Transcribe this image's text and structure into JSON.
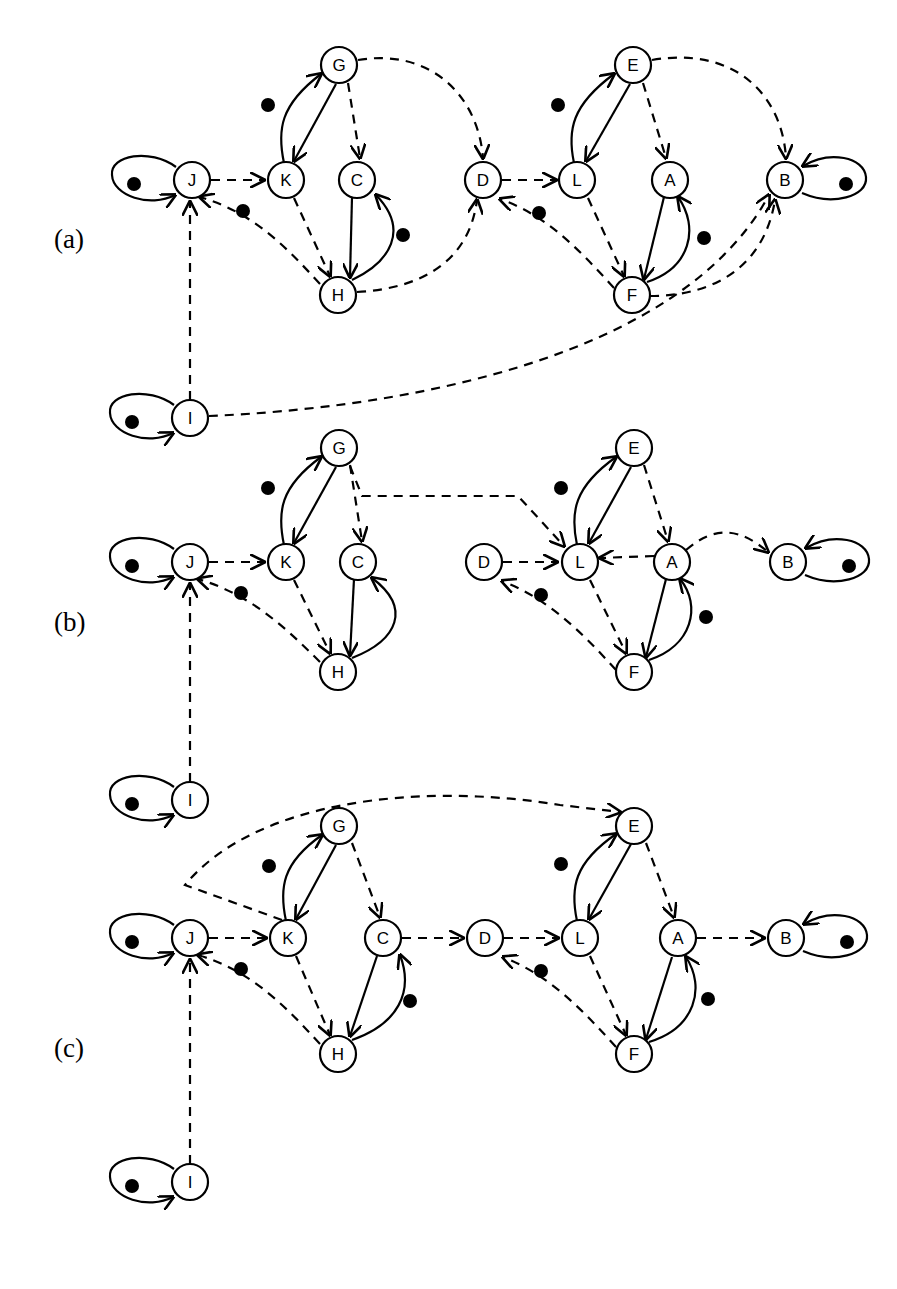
{
  "figure": {
    "background": "#ffffff",
    "stroke_color": "#000000",
    "node_fill": "#ffffff",
    "node_radius": 18,
    "dot_radius": 7,
    "width": 897,
    "height": 1289
  },
  "panels": [
    {
      "id": "a",
      "label": "(a)",
      "label_pos": {
        "x": 54,
        "y": 248
      },
      "nodes": [
        {
          "id": "J",
          "label": "J",
          "x": 192,
          "y": 180
        },
        {
          "id": "K",
          "label": "K",
          "x": 286,
          "y": 180
        },
        {
          "id": "C",
          "label": "C",
          "x": 357,
          "y": 180
        },
        {
          "id": "D",
          "label": "D",
          "x": 483,
          "y": 180
        },
        {
          "id": "L",
          "label": "L",
          "x": 577,
          "y": 180
        },
        {
          "id": "A",
          "label": "A",
          "x": 670,
          "y": 180
        },
        {
          "id": "B",
          "label": "B",
          "x": 785,
          "y": 180
        },
        {
          "id": "G",
          "label": "G",
          "x": 339,
          "y": 65
        },
        {
          "id": "E",
          "label": "E",
          "x": 633,
          "y": 65
        },
        {
          "id": "H",
          "label": "H",
          "x": 338,
          "y": 295
        },
        {
          "id": "F",
          "label": "F",
          "x": 632,
          "y": 295
        },
        {
          "id": "I",
          "label": "I",
          "x": 190,
          "y": 418
        }
      ],
      "edges": [
        {
          "from": "J",
          "to": "J",
          "style": "solid",
          "kind": "self-loop",
          "dot": true
        },
        {
          "from": "J",
          "to": "K",
          "style": "dashed"
        },
        {
          "from": "K",
          "to": "G",
          "style": "solid",
          "dot": true
        },
        {
          "from": "G",
          "to": "K",
          "style": "solid"
        },
        {
          "from": "K",
          "to": "H",
          "style": "dashed"
        },
        {
          "from": "G",
          "to": "C",
          "style": "dashed"
        },
        {
          "from": "H",
          "to": "C",
          "style": "solid",
          "dot": true
        },
        {
          "from": "C",
          "to": "H",
          "style": "solid"
        },
        {
          "from": "H",
          "to": "J",
          "style": "dashed",
          "dot": true
        },
        {
          "from": "G",
          "to": "D",
          "style": "dashed"
        },
        {
          "from": "H",
          "to": "D",
          "style": "dashed"
        },
        {
          "from": "D",
          "to": "L",
          "style": "dashed"
        },
        {
          "from": "L",
          "to": "E",
          "style": "solid",
          "dot": true
        },
        {
          "from": "E",
          "to": "L",
          "style": "solid"
        },
        {
          "from": "L",
          "to": "F",
          "style": "dashed"
        },
        {
          "from": "E",
          "to": "A",
          "style": "dashed"
        },
        {
          "from": "F",
          "to": "A",
          "style": "solid",
          "dot": true
        },
        {
          "from": "A",
          "to": "F",
          "style": "solid"
        },
        {
          "from": "F",
          "to": "D",
          "style": "dashed",
          "dot": true
        },
        {
          "from": "E",
          "to": "B",
          "style": "dashed"
        },
        {
          "from": "F",
          "to": "B",
          "style": "dashed"
        },
        {
          "from": "B",
          "to": "B",
          "style": "solid",
          "kind": "self-loop",
          "dot": true
        },
        {
          "from": "I",
          "to": "I",
          "style": "solid",
          "kind": "self-loop",
          "dot": true
        },
        {
          "from": "I",
          "to": "J",
          "style": "dashed"
        },
        {
          "from": "I",
          "to": "B",
          "style": "dashed",
          "kind": "long-arc"
        }
      ]
    },
    {
      "id": "b",
      "label": "(b)",
      "label_pos": {
        "x": 54,
        "y": 631
      },
      "nodes": [
        {
          "id": "J",
          "label": "J",
          "x": 190,
          "y": 562
        },
        {
          "id": "K",
          "label": "K",
          "x": 286,
          "y": 562
        },
        {
          "id": "C",
          "label": "C",
          "x": 358,
          "y": 562
        },
        {
          "id": "D",
          "label": "D",
          "x": 484,
          "y": 562
        },
        {
          "id": "L",
          "label": "L",
          "x": 580,
          "y": 562
        },
        {
          "id": "A",
          "label": "A",
          "x": 672,
          "y": 562
        },
        {
          "id": "B",
          "label": "B",
          "x": 788,
          "y": 562
        },
        {
          "id": "G",
          "label": "G",
          "x": 339,
          "y": 448
        },
        {
          "id": "E",
          "label": "E",
          "x": 634,
          "y": 448
        },
        {
          "id": "H",
          "label": "H",
          "x": 338,
          "y": 672
        },
        {
          "id": "F",
          "label": "F",
          "x": 634,
          "y": 672
        },
        {
          "id": "I",
          "label": "I",
          "x": 190,
          "y": 800
        }
      ],
      "edges": [
        {
          "from": "J",
          "to": "J",
          "style": "solid",
          "kind": "self-loop",
          "dot": true
        },
        {
          "from": "J",
          "to": "K",
          "style": "dashed"
        },
        {
          "from": "K",
          "to": "G",
          "style": "solid",
          "dot": true
        },
        {
          "from": "G",
          "to": "K",
          "style": "solid"
        },
        {
          "from": "K",
          "to": "H",
          "style": "dashed"
        },
        {
          "from": "G",
          "to": "C",
          "style": "dashed"
        },
        {
          "from": "H",
          "to": "C",
          "style": "solid"
        },
        {
          "from": "C",
          "to": "H",
          "style": "solid"
        },
        {
          "from": "H",
          "to": "J",
          "style": "dashed",
          "dot": true
        },
        {
          "from": "G",
          "to": "L",
          "style": "dashed",
          "kind": "orthogonal"
        },
        {
          "from": "D",
          "to": "L",
          "style": "dashed"
        },
        {
          "from": "L",
          "to": "E",
          "style": "solid",
          "dot": true
        },
        {
          "from": "E",
          "to": "L",
          "style": "solid"
        },
        {
          "from": "L",
          "to": "F",
          "style": "dashed"
        },
        {
          "from": "E",
          "to": "A",
          "style": "dashed"
        },
        {
          "from": "F",
          "to": "A",
          "style": "solid",
          "dot": true
        },
        {
          "from": "A",
          "to": "F",
          "style": "solid"
        },
        {
          "from": "F",
          "to": "D",
          "style": "dashed",
          "dot": true
        },
        {
          "from": "A",
          "to": "L",
          "style": "dashed"
        },
        {
          "from": "A",
          "to": "B",
          "style": "dashed"
        },
        {
          "from": "B",
          "to": "B",
          "style": "solid",
          "kind": "self-loop",
          "dot": true
        },
        {
          "from": "I",
          "to": "I",
          "style": "solid",
          "kind": "self-loop",
          "dot": true
        },
        {
          "from": "I",
          "to": "J",
          "style": "dashed"
        }
      ]
    },
    {
      "id": "c",
      "label": "(c)",
      "label_pos": {
        "x": 54,
        "y": 1057
      },
      "nodes": [
        {
          "id": "J",
          "label": "J",
          "x": 190,
          "y": 938
        },
        {
          "id": "K",
          "label": "K",
          "x": 288,
          "y": 938
        },
        {
          "id": "C",
          "label": "C",
          "x": 383,
          "y": 938
        },
        {
          "id": "D",
          "label": "D",
          "x": 485,
          "y": 938
        },
        {
          "id": "L",
          "label": "L",
          "x": 580,
          "y": 938
        },
        {
          "id": "A",
          "label": "A",
          "x": 678,
          "y": 938
        },
        {
          "id": "B",
          "label": "B",
          "x": 786,
          "y": 938
        },
        {
          "id": "G",
          "label": "G",
          "x": 339,
          "y": 826
        },
        {
          "id": "E",
          "label": "E",
          "x": 634,
          "y": 826
        },
        {
          "id": "H",
          "label": "H",
          "x": 338,
          "y": 1054
        },
        {
          "id": "F",
          "label": "F",
          "x": 634,
          "y": 1054
        },
        {
          "id": "I",
          "label": "I",
          "x": 190,
          "y": 1182
        }
      ],
      "edges": [
        {
          "from": "J",
          "to": "J",
          "style": "solid",
          "kind": "self-loop",
          "dot": true
        },
        {
          "from": "J",
          "to": "K",
          "style": "dashed"
        },
        {
          "from": "K",
          "to": "G",
          "style": "solid",
          "dot": true
        },
        {
          "from": "G",
          "to": "K",
          "style": "solid"
        },
        {
          "from": "K",
          "to": "H",
          "style": "dashed"
        },
        {
          "from": "G",
          "to": "C",
          "style": "dashed"
        },
        {
          "from": "H",
          "to": "C",
          "style": "solid",
          "dot": true
        },
        {
          "from": "C",
          "to": "H",
          "style": "solid"
        },
        {
          "from": "H",
          "to": "J",
          "style": "dashed",
          "dot": true
        },
        {
          "from": "C",
          "to": "D",
          "style": "dashed"
        },
        {
          "from": "D",
          "to": "L",
          "style": "dashed"
        },
        {
          "from": "L",
          "to": "E",
          "style": "solid",
          "dot": true
        },
        {
          "from": "E",
          "to": "L",
          "style": "solid"
        },
        {
          "from": "L",
          "to": "F",
          "style": "dashed"
        },
        {
          "from": "E",
          "to": "A",
          "style": "dashed"
        },
        {
          "from": "F",
          "to": "A",
          "style": "solid",
          "dot": true
        },
        {
          "from": "A",
          "to": "F",
          "style": "solid"
        },
        {
          "from": "F",
          "to": "D",
          "style": "dashed",
          "dot": true
        },
        {
          "from": "A",
          "to": "B",
          "style": "dashed"
        },
        {
          "from": "B",
          "to": "B",
          "style": "solid",
          "kind": "self-loop",
          "dot": true
        },
        {
          "from": "I",
          "to": "I",
          "style": "solid",
          "kind": "self-loop",
          "dot": true
        },
        {
          "from": "I",
          "to": "J",
          "style": "dashed"
        },
        {
          "from": "K",
          "to": "E",
          "style": "dashed",
          "kind": "long-arc-top"
        }
      ]
    }
  ]
}
